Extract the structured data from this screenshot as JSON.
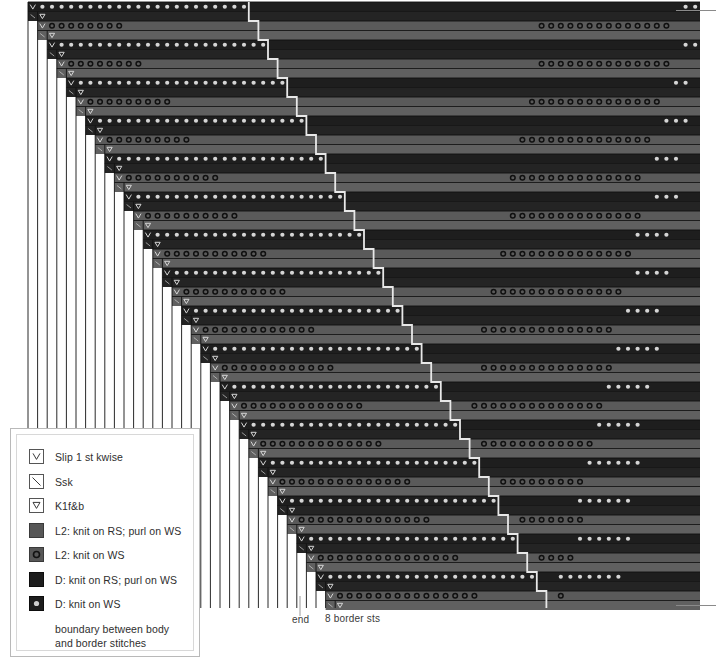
{
  "chart_data": {
    "type": "heatmap",
    "grid": {
      "columns": 70,
      "rows": 64,
      "cell_width": 9.6,
      "cell_height": 9.5,
      "origin_x": 28,
      "origin_y": 2
    },
    "axis_labels": {
      "end": "end",
      "border_sts": "8 border sts"
    },
    "colors": {
      "l2_row": "#5a5a5a",
      "l2_row_alt": "#606060",
      "d_row": "#1e1e1e",
      "d_row_alt": "#242424",
      "gridline": "#111111",
      "boundary_line": "#e8e8e8",
      "symbol_dark": "#101010",
      "symbol_light": "#d6d6d6",
      "background": "#ffffff",
      "hairline": "#8a8a8a"
    },
    "row_types": [
      "L2-RS",
      "L2-WS",
      "D-RS",
      "D-WS"
    ]
  },
  "legend": {
    "title": "Chart key",
    "items": [
      {
        "symbol": "slip-1-kwise",
        "glyph": "V",
        "label": "Slip 1 st kwise",
        "swatch": "outline"
      },
      {
        "symbol": "ssk",
        "glyph": "\\",
        "label": "Ssk",
        "swatch": "outline"
      },
      {
        "symbol": "k1f-and-b",
        "glyph": "V-bar",
        "label": "K1f&b",
        "swatch": "outline"
      },
      {
        "symbol": "l2-knit-rs-purl-ws",
        "glyph": "",
        "label": "L2: knit on RS; purl on WS",
        "swatch": "l2-solid"
      },
      {
        "symbol": "l2-knit-ws",
        "glyph": "o",
        "label": "L2: knit on WS",
        "swatch": "l2-open-dot"
      },
      {
        "symbol": "d-knit-rs-purl-ws",
        "glyph": "",
        "label": "D: knit on RS; purl on WS",
        "swatch": "d-solid"
      },
      {
        "symbol": "d-knit-ws",
        "glyph": "•",
        "label": "D: knit on WS",
        "swatch": "d-filled-dot"
      },
      {
        "symbol": "boundary-line",
        "glyph": "",
        "label": "boundary between body and border stitches",
        "swatch": "blank"
      }
    ]
  }
}
